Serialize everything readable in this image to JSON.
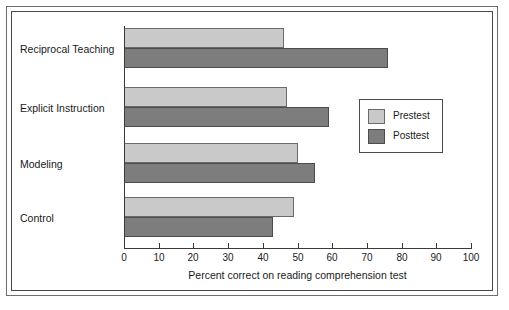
{
  "chart_data": {
    "type": "bar",
    "orientation": "horizontal",
    "title": "",
    "xlabel": "Percent correct on reading comprehension test",
    "ylabel": "",
    "xlim": [
      0,
      100
    ],
    "xticks": [
      0,
      10,
      20,
      30,
      40,
      50,
      60,
      70,
      80,
      90,
      100
    ],
    "xtick_labels": [
      "0",
      "10",
      "20",
      "30",
      "40",
      "50",
      "60",
      "70",
      "80",
      "90",
      "100"
    ],
    "grid": false,
    "legend_position": "center-right",
    "categories": [
      "Reciprocal Teaching",
      "Explicit Instruction",
      "Modeling",
      "Control"
    ],
    "series": [
      {
        "name": "Prestest",
        "color": "#c9c9c9",
        "values": [
          46,
          47,
          50,
          49
        ]
      },
      {
        "name": "Posttest",
        "color": "#7d7d7d",
        "values": [
          76,
          59,
          55,
          43
        ]
      }
    ]
  },
  "legend": {
    "items": [
      {
        "label": "Prestest",
        "swatch": "pre"
      },
      {
        "label": "Posttest",
        "swatch": "post"
      }
    ]
  },
  "colors": {
    "prestest": "#c9c9c9",
    "posttest": "#7d7d7d",
    "axis": "#3a3a3a",
    "frame": "#4a4a4a",
    "text": "#1a1a1a",
    "background": "#ffffff"
  }
}
